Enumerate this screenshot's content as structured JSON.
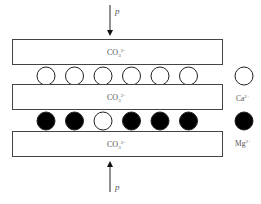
{
  "diagram": {
    "top_pressure": {
      "label": "p"
    },
    "bottom_pressure": {
      "label": "p"
    },
    "layers": [
      {
        "label": "CO",
        "sub": "3",
        "sup": "2-"
      },
      {
        "label": "CO",
        "sub": "3",
        "sup": "2-"
      },
      {
        "label": "CO",
        "sub": "3",
        "sup": "2-"
      }
    ],
    "ca_row": [
      "open",
      "open",
      "open",
      "open",
      "open",
      "open"
    ],
    "mg_row": [
      "filled",
      "filled",
      "open",
      "filled",
      "filled",
      "filled"
    ],
    "legend": [
      {
        "symbol": "open",
        "label": "Ca",
        "sup": "2+"
      },
      {
        "symbol": "filled",
        "label": "Mg",
        "sup": "2+"
      }
    ],
    "colors": {
      "stroke": "#222222",
      "filled": "#000000",
      "open": "#ffffff",
      "text": "#555555"
    }
  }
}
